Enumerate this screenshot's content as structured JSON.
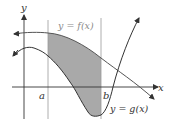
{
  "diagram": {
    "type": "area-between-curves",
    "axis_labels": {
      "x": "x",
      "y": "y"
    },
    "bounds": {
      "a": "a",
      "b": "b"
    },
    "curves": [
      {
        "name": "f",
        "label": "y = f(x)",
        "color": "#555555"
      },
      {
        "name": "g",
        "label": "y = g(x)",
        "color": "#333333"
      }
    ],
    "shaded_region": {
      "from": "a",
      "to": "b",
      "color": "#a8a8a8"
    }
  }
}
